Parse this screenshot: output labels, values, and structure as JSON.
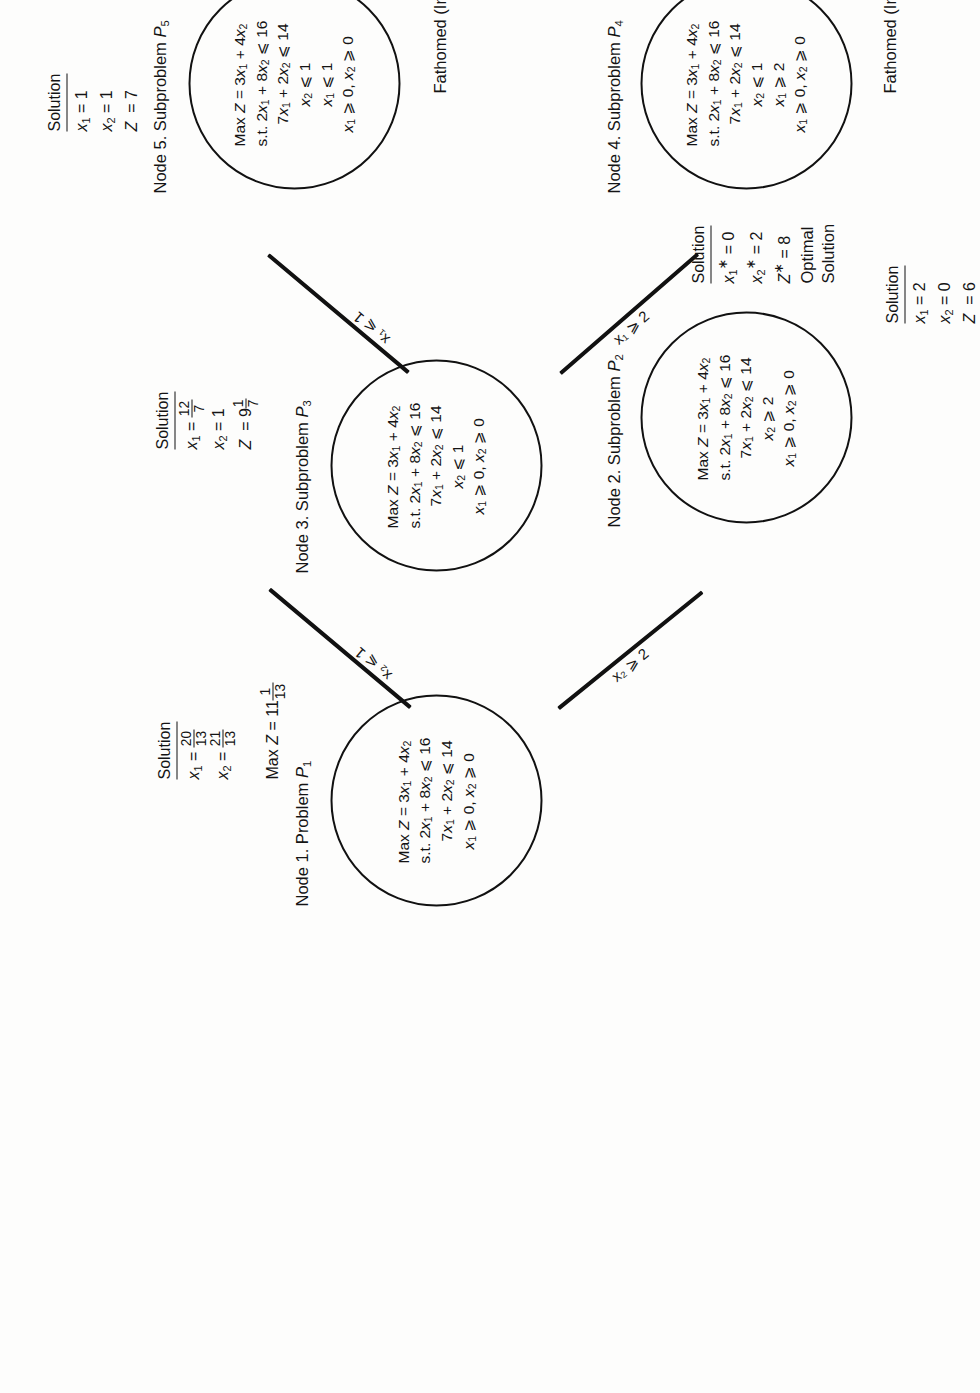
{
  "diagram": {
    "type": "branch-and-bound-tree",
    "orientation": "rotated-90-ccw"
  },
  "nodes": [
    {
      "id": "n1",
      "title": "Node 1. Problem P",
      "title_sub": "1",
      "lines": [
        "Max Z = 3x₁ + 4x₂",
        "s.t. 2x₁ + 8x₂ ≤ 16",
        "7x₁ + 2x₂ ≤ 14",
        "x₁ ≥ 0, x₂ ≥ 0"
      ],
      "objective": "Max Z = 3x1 + 4x2",
      "constraints": [
        "2x1 + 8x2 <= 16",
        "7x1 + 2x2 <= 14",
        "x1 >= 0, x2 >= 0"
      ],
      "solution_label": "Solution",
      "solution": [
        "x₁ = 20/13",
        "x₂ = 21/13"
      ],
      "extra": "Max Z = 11 1/13"
    },
    {
      "id": "n2",
      "title": "Node 2. Subproblem P",
      "title_sub": "2",
      "lines": [
        "Max Z = 3x₁ + 4x₂",
        "s.t. 2x₁ + 8x₂ ≤ 16",
        "7x₁ + 2x₂ ≤ 14",
        "x₂ ≥ 2",
        "x₁ ≥ 0, x₂ ≥ 0"
      ],
      "solution_label": "Solution",
      "solution": [
        "x₁* = 0",
        "x₂* = 2",
        "Z* = 8"
      ],
      "status": "Optimal Solution"
    },
    {
      "id": "n3",
      "title": "Node 3. Subproblem P",
      "title_sub": "3",
      "lines": [
        "Max Z = 3x₁ + 4x₂",
        "s.t. 2x₁ + 8x₂ ≤ 16",
        "7x₁ + 2x₂ ≤ 14",
        "x₂ ≤ 1",
        "x₁ ≥ 0, x₂ ≥ 0"
      ],
      "solution_label": "Solution",
      "solution": [
        "x₁ = 12/7",
        "x₂ = 1",
        "Z = 9 1/7"
      ]
    },
    {
      "id": "n4",
      "title": "Node 4. Subproblem P",
      "title_sub": "4",
      "lines": [
        "Max Z = 3x₁ + 4x₂",
        "s.t. 2x₁ + 8x₂ ≤ 16",
        "7x₁ + 2x₂ ≤ 14",
        "x₂ ≤ 1",
        "x₁ ≥ 2",
        "x₁ ≥ 0, x₂ ≥ 0"
      ],
      "solution_label": "Solution",
      "solution": [
        "x₁ = 2",
        "x₂ = 0",
        "Z = 6"
      ],
      "status": "Fathomed (Integrality)"
    },
    {
      "id": "n5",
      "title": "Node 5. Subproblem P",
      "title_sub": "5",
      "lines": [
        "Max Z = 3x₁ + 4x₂",
        "s.t. 2x₁ + 8x₂ ≤ 16",
        "7x₁ + 2x₂ ≤ 14",
        "x₂ ≤ 1",
        "x₁ ≤ 1",
        "x₁ ≥ 0, x₂ ≥ 0"
      ],
      "solution_label": "Solution",
      "solution": [
        "x₁ = 1",
        "x₂ = 1",
        "Z = 7"
      ],
      "status": "Fathomed (Integrality)"
    }
  ],
  "edges": [
    {
      "from": "n1",
      "to": "n2",
      "label": "x₂ ≥ 2"
    },
    {
      "from": "n1",
      "to": "n3",
      "label": "x₂ ≤ 1"
    },
    {
      "from": "n3",
      "to": "n4",
      "label": "x₁ ≥ 2"
    },
    {
      "from": "n3",
      "to": "n5",
      "label": "x₁ ≤ 1"
    }
  ],
  "labels": {
    "node1_title": "Node 1. Problem",
    "node1_p": "P",
    "node1_idx": "1",
    "node2_title": "Node 2. Subproblem",
    "node2_p": "P",
    "node2_idx": "2",
    "node3_title": "Node 3. Subproblem",
    "node3_p": "P",
    "node3_idx": "3",
    "node4_title": "Node 4. Subproblem",
    "node4_p": "P",
    "node4_idx": "4",
    "node5_title": "Node 5. Subproblem",
    "node5_p": "P",
    "node5_idx": "5",
    "solution": "Solution",
    "fathomed": "Fathomed (Integrality)",
    "optimal_line1": "Optimal",
    "optimal_line2": "Solution",
    "edge_x2_ge2": "x₂ ⩾ 2",
    "edge_x2_le1": "x₂ ⩽ 1",
    "edge_x1_ge2": "x₁ ⩾ 2",
    "edge_x1_le1": "x₁ ⩽ 1"
  },
  "colors": {
    "ink": "#141414",
    "paper": "#fdfdfc"
  }
}
